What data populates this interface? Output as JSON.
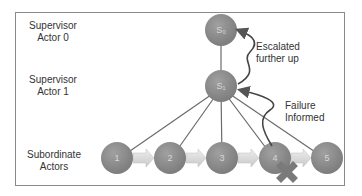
{
  "diagram": {
    "row_labels": [
      {
        "line1": "Supervisor",
        "line2": "Actor 0"
      },
      {
        "line1": "Supervisor",
        "line2": "Actor 1"
      },
      {
        "line1": "Subordinate",
        "line2": "Actors"
      }
    ],
    "supervisors": [
      {
        "id": "s0",
        "label": "S₀"
      },
      {
        "id": "s1",
        "label": "S₁"
      }
    ],
    "subordinates": [
      {
        "id": "1",
        "label": "1"
      },
      {
        "id": "2",
        "label": "2"
      },
      {
        "id": "3",
        "label": "3"
      },
      {
        "id": "4",
        "label": "4",
        "failed": true
      },
      {
        "id": "5",
        "label": "5"
      }
    ],
    "annotations": {
      "escalated_line1": "Escalated",
      "escalated_line2": "further up",
      "failure_line1": "Failure",
      "failure_line2": "Informed"
    },
    "colors": {
      "node": "#8c8c8c",
      "node_label": "#d8d8d8",
      "edge": "#6b6b6b",
      "arrow_fill": "#dcdcdc",
      "cross": "#7a7a7a"
    }
  }
}
